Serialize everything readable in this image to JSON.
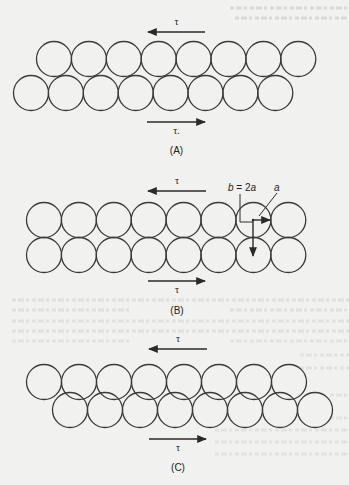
{
  "figure": {
    "stroke_color": "#3a3a3a",
    "background_color": "#f1f1ef",
    "panels": [
      {
        "id": "A",
        "label": "(A)",
        "stress_top_label": "τ",
        "stress_bottom_label": "τ.",
        "top_row": {
          "count": 8,
          "start_cx": 54,
          "cy": 59,
          "spacing": 34.9,
          "r": 17.5
        },
        "bottom_row": {
          "count": 8,
          "start_cx": 31,
          "cy": 93,
          "spacing": 34.9,
          "r": 17.5
        },
        "arrow_top": {
          "y": 32,
          "x1": 205,
          "x2": 148,
          "direction": "left"
        },
        "arrow_bottom": {
          "y": 122,
          "x1": 147,
          "x2": 205,
          "direction": "right"
        },
        "tau_top_y": 25,
        "tau_bottom_y": 134,
        "label_y": 154
      },
      {
        "id": "B",
        "label": "(B)",
        "stress_top_label": "τ",
        "stress_bottom_label": "τ",
        "top_row": {
          "count": 8,
          "start_cx": 44,
          "cy": 220,
          "spacing": 34.9,
          "r": 17.5
        },
        "bottom_row": {
          "count": 8,
          "start_cx": 44,
          "cy": 255,
          "spacing": 34.9,
          "r": 17.5
        },
        "arrow_top": {
          "y": 191,
          "x1": 206,
          "x2": 148,
          "direction": "left"
        },
        "arrow_bottom": {
          "y": 281,
          "x1": 148,
          "x2": 205,
          "direction": "right"
        },
        "tau_top_y": 184,
        "tau_bottom_y": 293,
        "label_y": 314,
        "annotations": {
          "b_label": "b",
          "b_eq": " = 2",
          "b_a": "a",
          "a_label": "a"
        }
      },
      {
        "id": "C",
        "label": "(C)",
        "stress_top_label": "τ",
        "stress_bottom_label": "τ",
        "top_row": {
          "count": 8,
          "start_cx": 44,
          "cy": 382,
          "spacing": 35.0,
          "r": 17.5
        },
        "bottom_row": {
          "count": 8,
          "start_cx": 70,
          "cy": 410,
          "spacing": 35.0,
          "r": 17.5
        },
        "arrow_top": {
          "y": 349,
          "x1": 207,
          "x2": 149,
          "direction": "left"
        },
        "arrow_bottom": {
          "y": 439,
          "x1": 149,
          "x2": 206,
          "direction": "right"
        },
        "tau_top_y": 342,
        "tau_bottom_y": 451,
        "label_y": 471
      }
    ]
  }
}
